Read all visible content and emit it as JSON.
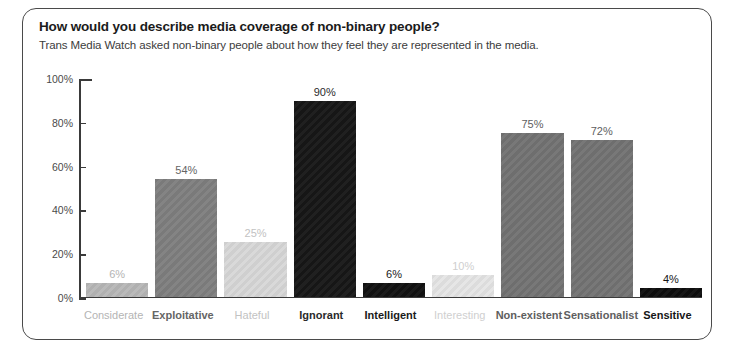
{
  "card": {
    "title": "How would you describe media coverage of non-binary people?",
    "subtitle": "Trans Media Watch asked non-binary people about how they feel they are represented in the media."
  },
  "chart_data": {
    "type": "bar",
    "title": "How would you describe media coverage of non-binary people?",
    "subtitle": "Trans Media Watch asked non-binary people about how they feel they are represented in the media.",
    "xlabel": "",
    "ylabel": "",
    "ylim": [
      0,
      100
    ],
    "grid": false,
    "legend": "none",
    "y_ticks": [
      "0%",
      "20%",
      "40%",
      "60%",
      "80%",
      "100%"
    ],
    "y_tick_values": [
      0,
      20,
      40,
      60,
      80,
      100
    ],
    "categories": [
      "Considerate",
      "Exploitative",
      "Hateful",
      "Ignorant",
      "Intelligent",
      "Interesting",
      "Non-existent",
      "Sensationalist",
      "Sensitive"
    ],
    "values": [
      6,
      54,
      25,
      90,
      6,
      10,
      75,
      72,
      4
    ],
    "value_labels": [
      "6%",
      "54%",
      "25%",
      "90%",
      "6%",
      "10%",
      "75%",
      "72%",
      "4%"
    ],
    "bar_colors": [
      "#b0b0b0",
      "#7a7a7a",
      "#cfcfcf",
      "#161616",
      "#111111",
      "#dcdcdc",
      "#6e6e6e",
      "#6e6e6e",
      "#0d0d0d"
    ],
    "label_colors": [
      "#b4b4b4",
      "#656565",
      "#c2c2c2",
      "#2a2a2a",
      "#1a1a1a",
      "#cfcfcf",
      "#5e5e5e",
      "#5e5e5e",
      "#151515"
    ],
    "axis_color": "#3a3a3a",
    "background": "#ffffff"
  }
}
